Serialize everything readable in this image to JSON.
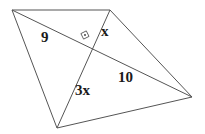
{
  "figure": {
    "kind": "geometry-diagram",
    "stroke_color": "#555555",
    "top_edge_color": "#8c8c8c",
    "background_color": "#ffffff",
    "label_color": "#1a1a1a",
    "right_angle_marker": {
      "name": "right-angle-square",
      "has_center_dot": true,
      "center_x": 86,
      "center_y": 37
    },
    "vertices": [
      {
        "name": "top-left",
        "x": 12,
        "y": 10
      },
      {
        "name": "top-right",
        "x": 110,
        "y": 10
      },
      {
        "name": "right",
        "x": 192,
        "y": 97
      },
      {
        "name": "bottom",
        "x": 57,
        "y": 128
      }
    ],
    "edges": [
      {
        "name": "top-edge",
        "from": "top-left",
        "to": "top-right"
      },
      {
        "name": "left-edge",
        "from": "top-left",
        "to": "bottom"
      },
      {
        "name": "bottom-edge",
        "from": "bottom",
        "to": "right"
      },
      {
        "name": "right-edge",
        "from": "top-right",
        "to": "right"
      },
      {
        "name": "diagonal-9-10",
        "from": "top-left",
        "to": "right"
      },
      {
        "name": "diagonal-x-3x",
        "from": "top-right",
        "to": "bottom"
      }
    ],
    "labels": {
      "nine": "9",
      "x": "x",
      "ten": "10",
      "three_x": "3x"
    }
  }
}
